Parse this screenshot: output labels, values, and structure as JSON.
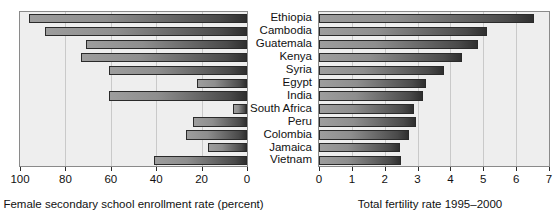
{
  "chart_data": {
    "type": "bar",
    "orientation": "horizontal",
    "title": "",
    "categories": [
      "Ethiopia",
      "Cambodia",
      "Guatemala",
      "Kenya",
      "Syria",
      "Egypt",
      "India",
      "South Africa",
      "Peru",
      "Colombia",
      "Jamaica",
      "Vietnam"
    ],
    "panels": [
      {
        "id": "left",
        "xlabel": "Female secondary school enrollment rate (percent)",
        "ylabel": "",
        "xlim": [
          100,
          0
        ],
        "reversed": true,
        "ticks": [
          100,
          80,
          60,
          40,
          20,
          0
        ],
        "ticklabels": [
          "100",
          "80",
          "60",
          "40",
          "20",
          "0"
        ],
        "grid": true,
        "values": [
          4,
          11,
          29,
          27,
          39,
          78,
          39,
          94,
          76,
          73,
          83,
          59
        ]
      },
      {
        "id": "right",
        "xlabel": "Total fertility rate 1995–2000",
        "ylabel": "",
        "xlim": [
          0,
          7
        ],
        "reversed": false,
        "ticks": [
          0,
          1,
          2,
          3,
          4,
          5,
          6,
          7
        ],
        "ticklabels": [
          "0",
          "1",
          "2",
          "3",
          "4",
          "5",
          "6",
          "7"
        ],
        "grid": true,
        "values": [
          6.55,
          5.1,
          4.85,
          4.35,
          3.8,
          3.25,
          3.15,
          2.9,
          2.95,
          2.75,
          2.45,
          2.5
        ]
      }
    ],
    "colors": {
      "bar_light": "#9d9d9d",
      "bar_dark": "#2f2f2f",
      "panel_background": "#eeeeee",
      "gridline": "#c9c9c9",
      "axis": "#2b2b2b",
      "text": "#111111"
    }
  }
}
